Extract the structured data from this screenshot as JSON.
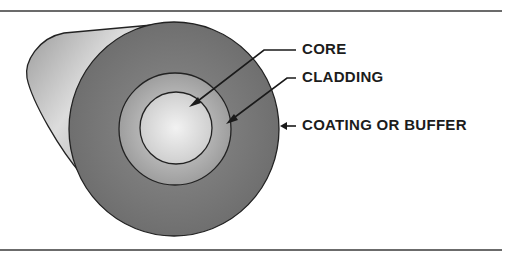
{
  "diagram": {
    "labels": {
      "core": "CORE",
      "cladding": "CLADDING",
      "coating": "COATING OR BUFFER"
    },
    "colors": {
      "coating": "#7a7a7a",
      "cylinder_body": "#bdbdbd",
      "cladding": "#b8b8b8",
      "core": "#e6e6e6",
      "outline": "#222222",
      "rule": "#6b6b6b"
    }
  }
}
